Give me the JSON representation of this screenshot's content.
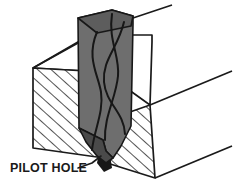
{
  "figure": {
    "title": "PILOT HOLE",
    "background_color": "#ffffff",
    "line_color": "#1a1a1a",
    "hatch_color": "#1a1a1a",
    "drill_body_color": "#6e6e6e",
    "drill_shadow_color": "#4a4a4a",
    "drill_dark_color": "#171717",
    "view": {
      "width": 236,
      "height": 191
    }
  },
  "callout": {
    "label": "PILOT HOLE",
    "label_x": 10,
    "label_y": 172,
    "leader_points": "78,168 92,163 101,156",
    "leader_width": 1.6
  },
  "workpiece": {
    "name": "sectioned-block",
    "top_face_points": "33,68 90,35 152,35 152,42 150,105 104,72",
    "top_left_edge": "33,68 96,33",
    "top_right_edge": "150,105 232,71",
    "bottom_right_edge": "155,178 232,146",
    "left_face_points": "33,68 104,72 104,158 33,148",
    "right_face_points": "107,120 150,105 155,178 107,163",
    "front_notch_points": "104,72 104,158 107,163 107,120",
    "outline_width": 1.7,
    "hatch_spacing": 9,
    "hatch_angle_deg": -48,
    "hatch_width": 1.5
  },
  "drill": {
    "name": "twist-drill-bit",
    "body_points": "78,18 112,10 133,16 133,24 131,126 121,146 113,158 106,151 103,140 79,128",
    "shank_top_points": "78,18 112,10 133,16 131,26 97,33",
    "tip_points": "79,128 103,140 106,151 113,158 106,163 97,156 86,142",
    "flutes": [
      "M 97,32 C 86,58 98,74 101,92 C 104,112 94,130 92,150",
      "M 124,22 C 118,48 102,60 104,82 C 106,104 124,112 125,134",
      "M 112,14 C 108,40 120,56 118,76 C 116,98 104,116 105,140"
    ],
    "flute_width": 2.0,
    "edge_width": 1.6,
    "top_stem": "133,18 172,5",
    "top_stem_width": 1.6
  },
  "pilot_hole": {
    "name": "pilot-hole-wedge",
    "points": "99,152 110,155 112,168 104,172 97,163",
    "fill": "#171717"
  }
}
